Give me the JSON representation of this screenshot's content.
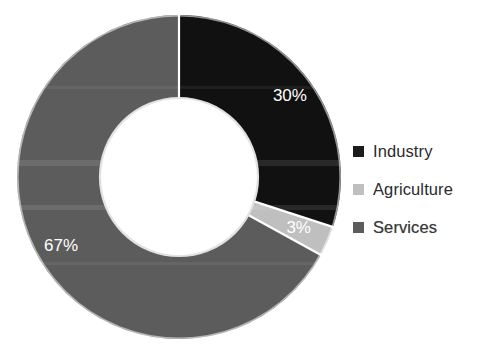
{
  "chart_data": {
    "type": "pie",
    "variant": "donut",
    "title": "",
    "subtitle": "",
    "xlabel": "",
    "ylabel": "",
    "categories": [
      "Industry",
      "Agriculture",
      "Services"
    ],
    "values": [
      30,
      3,
      67
    ],
    "value_unit": "%",
    "data_labels": [
      "30%",
      "3%",
      "67%"
    ],
    "colors": [
      "#111111",
      "#bfbfbf",
      "#5c5c5c"
    ],
    "label_colors": [
      "#ffffff",
      "#ffffff",
      "#ffffff"
    ],
    "start_angle_deg": 0,
    "direction": "clockwise",
    "hole_ratio": 0.49,
    "legend_position": "right",
    "grid": false,
    "slices": [
      {
        "name": "Industry",
        "value": 30,
        "label": "30%",
        "color": "#111111",
        "start_deg": 0,
        "end_deg": 108
      },
      {
        "name": "Agriculture",
        "value": 3,
        "label": "3%",
        "color": "#bfbfbf",
        "start_deg": 108,
        "end_deg": 118.8
      },
      {
        "name": "Services",
        "value": 67,
        "label": "67%",
        "color": "#5c5c5c",
        "start_deg": 118.8,
        "end_deg": 360
      }
    ]
  },
  "legend": {
    "items": [
      {
        "label": "Industry",
        "color": "#1b1b1b"
      },
      {
        "label": "Agriculture",
        "color": "#bfbfbf"
      },
      {
        "label": "Services",
        "color": "#5c5c5c"
      }
    ]
  },
  "geometry": {
    "center_x": 179,
    "center_y": 177,
    "outer_radius": 162,
    "inner_radius": 79,
    "separator_color": "#ffffff",
    "separator_width": 2.2
  }
}
